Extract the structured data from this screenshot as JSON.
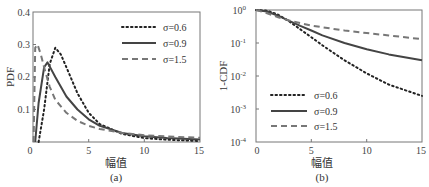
{
  "chart_data": [
    {
      "type": "line",
      "panel": "(a)",
      "xlabel": "幅值",
      "ylabel": "PDF",
      "xlim": [
        0,
        15
      ],
      "ylim": [
        0,
        0.4
      ],
      "xticks": [
        "0",
        "5",
        "10",
        "15"
      ],
      "yticks": [
        "0.1",
        "0.2",
        "0.3",
        "0.4"
      ],
      "grid": false,
      "legend_position": "upper right",
      "series": [
        {
          "name": "σ=0.6",
          "style": "dotted",
          "x": [
            0.5,
            1,
            1.5,
            2,
            2.5,
            3,
            4,
            5,
            6,
            8,
            10,
            12,
            15
          ],
          "y": [
            0.0,
            0.1,
            0.24,
            0.29,
            0.27,
            0.23,
            0.15,
            0.09,
            0.055,
            0.025,
            0.012,
            0.007,
            0.003
          ]
        },
        {
          "name": "σ=0.9",
          "style": "solid",
          "x": [
            0.2,
            0.5,
            1,
            1.3,
            2,
            3,
            4,
            5,
            6,
            8,
            10,
            12,
            15
          ],
          "y": [
            0.0,
            0.12,
            0.23,
            0.245,
            0.2,
            0.14,
            0.1,
            0.07,
            0.05,
            0.028,
            0.018,
            0.012,
            0.008
          ]
        },
        {
          "name": "σ=1.5",
          "style": "dashed",
          "x": [
            0.05,
            0.2,
            0.4,
            0.7,
            1,
            1.5,
            2,
            3,
            4,
            5,
            6,
            8,
            10,
            12,
            15
          ],
          "y": [
            0.0,
            0.29,
            0.3,
            0.27,
            0.23,
            0.17,
            0.13,
            0.09,
            0.065,
            0.05,
            0.04,
            0.028,
            0.021,
            0.017,
            0.013
          ]
        }
      ]
    },
    {
      "type": "line",
      "panel": "(b)",
      "xlabel": "幅值",
      "ylabel": "1-CDF",
      "xlim": [
        0,
        15
      ],
      "ylim": [
        0.0001,
        1
      ],
      "yscale": "log",
      "xticks": [
        "0",
        "5",
        "10",
        "15"
      ],
      "yticks": [
        "10⁻⁴",
        "10⁻³",
        "10⁻²",
        "10⁻¹",
        "10⁰"
      ],
      "grid": false,
      "legend_position": "lower left",
      "series": [
        {
          "name": "σ=0.6",
          "style": "dotted",
          "x": [
            0,
            1,
            2,
            3,
            4,
            5,
            6,
            8,
            10,
            12,
            15
          ],
          "y": [
            1.0,
            0.95,
            0.72,
            0.45,
            0.26,
            0.15,
            0.085,
            0.03,
            0.012,
            0.0055,
            0.0025
          ]
        },
        {
          "name": "σ=0.9",
          "style": "solid",
          "x": [
            0,
            1,
            2,
            3,
            4,
            5,
            6,
            8,
            10,
            12,
            15
          ],
          "y": [
            1.0,
            0.9,
            0.67,
            0.47,
            0.33,
            0.24,
            0.17,
            0.1,
            0.065,
            0.045,
            0.03
          ]
        },
        {
          "name": "σ=1.5",
          "style": "dashed",
          "x": [
            0,
            1,
            2,
            3,
            4,
            5,
            6,
            8,
            10,
            12,
            15
          ],
          "y": [
            1.0,
            0.8,
            0.6,
            0.48,
            0.4,
            0.34,
            0.3,
            0.24,
            0.2,
            0.17,
            0.13
          ]
        }
      ]
    }
  ],
  "panels": {
    "a": {
      "caption": "(a)",
      "xlabel": "幅值",
      "ylabel": "PDF",
      "xticks": [
        "0",
        "5",
        "10",
        "15"
      ],
      "yticks": [
        "0.1",
        "0.2",
        "0.3",
        "0.4"
      ],
      "legend": [
        "σ=0.6",
        "σ=0.9",
        "σ=1.5"
      ]
    },
    "b": {
      "caption": "(b)",
      "xlabel": "幅值",
      "ylabel": "1-CDF",
      "xticks": [
        "0",
        "5",
        "10",
        "15"
      ],
      "legend": [
        "σ=0.6",
        "σ=0.9",
        "σ=1.5"
      ]
    }
  }
}
